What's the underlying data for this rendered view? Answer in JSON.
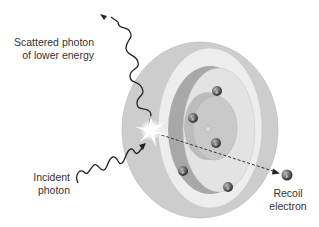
{
  "labels": {
    "scattered_line1": "Scattered photon",
    "scattered_line2": "of lower energy",
    "incident_line1": "Incident",
    "incident_line2": "photon",
    "recoil_line1": "Recoil",
    "recoil_line2": "electron"
  },
  "electron_symbol": "e⁻",
  "colors": {
    "outer_shell": "#cfcfcf",
    "outer_face": "#ececec",
    "inner_crescent": "#a9a9a9",
    "inner_face": "#e4e4e4",
    "nucleus_region": "#c6c6c6",
    "electron": "#6b6b6b",
    "wave": "#222222"
  }
}
